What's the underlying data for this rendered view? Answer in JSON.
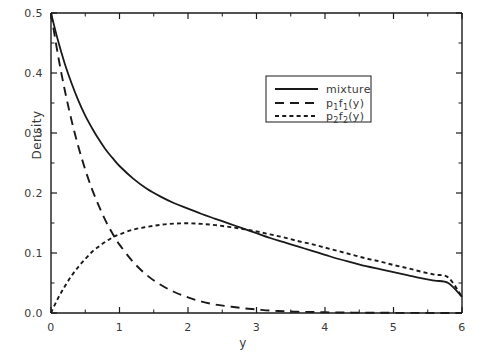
{
  "chart_data": {
    "type": "line",
    "title": "",
    "xlabel": "y",
    "ylabel": "Density",
    "xlim": [
      0,
      6
    ],
    "ylim": [
      0.0,
      0.5
    ],
    "grid": false,
    "legend_position": "upper-right",
    "xticks": [
      "0",
      "1",
      "2",
      "3",
      "4",
      "5",
      "6"
    ],
    "xtick_values": [
      0,
      1,
      2,
      3,
      4,
      5,
      6
    ],
    "xminor_step": 0.5,
    "yticks": [
      "0.0",
      "0.1",
      "0.2",
      "0.3",
      "0.4",
      "0.5"
    ],
    "ytick_values": [
      0.0,
      0.1,
      0.2,
      0.3,
      0.4,
      0.5
    ],
    "yminor_step": 0.05,
    "x": [
      0,
      0.1,
      0.2,
      0.3,
      0.4,
      0.5,
      0.6,
      0.7,
      0.8,
      0.9,
      1.0,
      1.2,
      1.4,
      1.6,
      1.8,
      2.0,
      2.2,
      2.4,
      2.6,
      2.8,
      3.0,
      3.2,
      3.4,
      3.6,
      3.8,
      4.0,
      4.2,
      4.4,
      4.6,
      4.8,
      5.0,
      5.2,
      5.4,
      5.6,
      5.8,
      6.0
    ],
    "series": [
      {
        "name": "mixture",
        "style": "solid",
        "color": "#1a1a1a",
        "values": [
          0.5,
          0.455,
          0.416,
          0.383,
          0.354,
          0.329,
          0.308,
          0.289,
          0.272,
          0.258,
          0.245,
          0.224,
          0.207,
          0.194,
          0.183,
          0.174,
          0.165,
          0.157,
          0.149,
          0.141,
          0.133,
          0.125,
          0.118,
          0.111,
          0.104,
          0.097,
          0.09,
          0.084,
          0.078,
          0.073,
          0.068,
          0.063,
          0.058,
          0.054,
          0.05,
          0.027
        ]
      },
      {
        "name": "p1f1(y)",
        "label_base": "p",
        "label_sub1": "1",
        "label_f": "f",
        "label_sub2": "1",
        "label_arg": "(y)",
        "style": "long-dash",
        "color": "#1a1a1a",
        "values": [
          0.5,
          0.431,
          0.372,
          0.321,
          0.277,
          0.239,
          0.206,
          0.178,
          0.153,
          0.132,
          0.114,
          0.085,
          0.063,
          0.047,
          0.035,
          0.026,
          0.019,
          0.014,
          0.011,
          0.008,
          0.006,
          0.004,
          0.003,
          0.002,
          0.0017,
          0.0012,
          0.0009,
          0.0007,
          0.0005,
          0.0004,
          0.0003,
          0.0002,
          0.0002,
          0.0001,
          0.0001,
          0.0001
        ]
      },
      {
        "name": "p2f2(y)",
        "label_base": "p",
        "label_sub1": "2",
        "label_f": "f",
        "label_sub2": "2",
        "label_arg": "(y)",
        "style": "short-dash",
        "color": "#1a1a1a",
        "values": [
          0.0,
          0.024,
          0.044,
          0.062,
          0.077,
          0.09,
          0.102,
          0.111,
          0.119,
          0.126,
          0.131,
          0.139,
          0.1435,
          0.147,
          0.149,
          0.1495,
          0.1485,
          0.1465,
          0.1435,
          0.14,
          0.136,
          0.131,
          0.126,
          0.12,
          0.115,
          0.109,
          0.103,
          0.097,
          0.091,
          0.086,
          0.08,
          0.075,
          0.069,
          0.064,
          0.059,
          0.027
        ]
      }
    ],
    "annotations": [
      {
        "text": "crossing of p1f1 and p2f2",
        "x": 1.4,
        "y": 0.115
      }
    ]
  },
  "legend": {
    "entries": [
      {
        "label": "mixture",
        "style": "solid"
      },
      {
        "label": "p1f1(y)",
        "style": "long-dash"
      },
      {
        "label": "p2f2(y)",
        "style": "short-dash"
      }
    ]
  }
}
